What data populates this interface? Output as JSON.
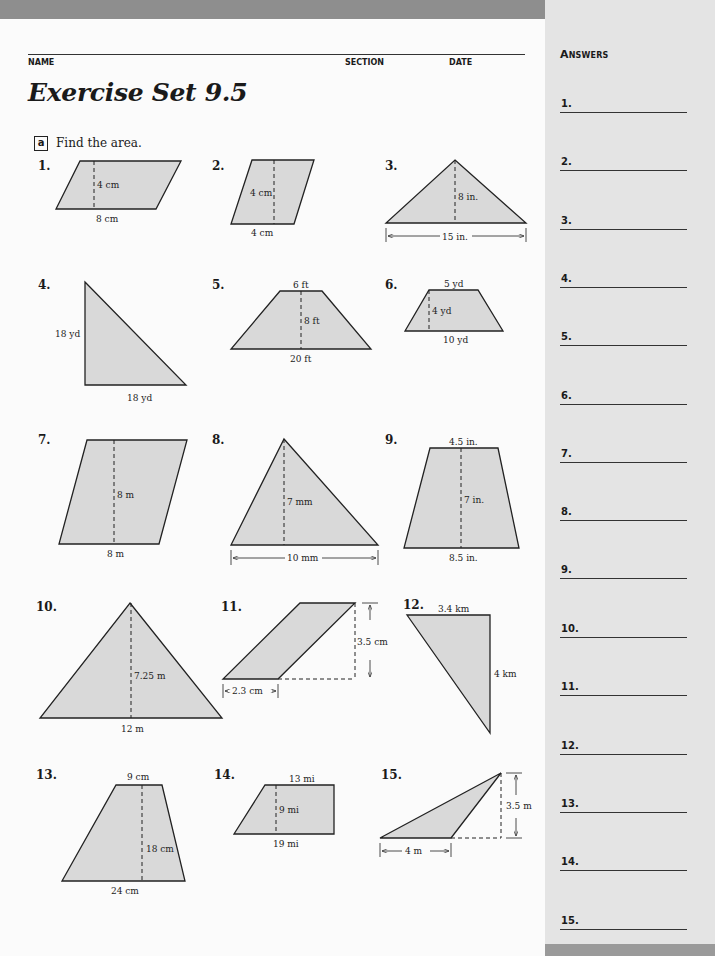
{
  "header": {
    "name_label": "NAME",
    "section_label": "SECTION",
    "date_label": "DATE",
    "title": "Exercise Set 9.5"
  },
  "section": {
    "letter": "a",
    "instruction": "Find the area."
  },
  "exercises": [
    {
      "num": "1.",
      "shape": "parallelogram",
      "labels": [
        "4 cm",
        "8 cm"
      ]
    },
    {
      "num": "2.",
      "shape": "parallelogram",
      "labels": [
        "4 cm",
        "4 cm"
      ]
    },
    {
      "num": "3.",
      "shape": "triangle",
      "labels": [
        "8 in.",
        "15 in."
      ]
    },
    {
      "num": "4.",
      "shape": "right-triangle",
      "labels": [
        "18 yd",
        "18 yd"
      ]
    },
    {
      "num": "5.",
      "shape": "trapezoid",
      "labels": [
        "6 ft",
        "8 ft",
        "20 ft"
      ]
    },
    {
      "num": "6.",
      "shape": "trapezoid",
      "labels": [
        "5 yd",
        "4 yd",
        "10 yd"
      ]
    },
    {
      "num": "7.",
      "shape": "parallelogram",
      "labels": [
        "8 m",
        "8 m"
      ]
    },
    {
      "num": "8.",
      "shape": "triangle",
      "labels": [
        "7 mm",
        "10 mm"
      ]
    },
    {
      "num": "9.",
      "shape": "trapezoid",
      "labels": [
        "4.5 in.",
        "7 in.",
        "8.5 in."
      ]
    },
    {
      "num": "10.",
      "shape": "triangle",
      "labels": [
        "7.25 m",
        "12 m"
      ]
    },
    {
      "num": "11.",
      "shape": "parallelogram",
      "labels": [
        "3.5 cm",
        "2.3 cm"
      ]
    },
    {
      "num": "12.",
      "shape": "right-triangle",
      "labels": [
        "3.4 km",
        "4 km"
      ]
    },
    {
      "num": "13.",
      "shape": "trapezoid",
      "labels": [
        "9 cm",
        "18 cm",
        "24 cm"
      ]
    },
    {
      "num": "14.",
      "shape": "trapezoid",
      "labels": [
        "13 mi",
        "9 mi",
        "19 mi"
      ]
    },
    {
      "num": "15.",
      "shape": "obtuse-triangle",
      "labels": [
        "3.5 m",
        "4 m"
      ]
    }
  ],
  "answers": {
    "title": "Answers",
    "items": [
      "1.",
      "2.",
      "3.",
      "4.",
      "5.",
      "6.",
      "7.",
      "8.",
      "9.",
      "10.",
      "11.",
      "12.",
      "13.",
      "14.",
      "15."
    ]
  }
}
